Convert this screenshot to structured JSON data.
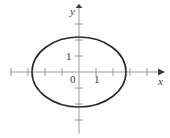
{
  "figure": {
    "name": "ellipse-coordinate-plot",
    "background_color": "#ffffff",
    "width": 170,
    "height": 138
  },
  "axes": {
    "x_axis": {
      "label": "x",
      "color": "#9a9a9a",
      "origin_px": 79,
      "y_px": 72,
      "start_px": 10,
      "end_px": 158,
      "arrow": "right",
      "arrow_color": "#3a3a3a",
      "tick_spacing_px": 17,
      "tick_positions_px": [
        11,
        28,
        45,
        62,
        96,
        113,
        130,
        147
      ],
      "tick_half_len_px": 4
    },
    "y_axis": {
      "label": "y",
      "color": "#9a9a9a",
      "origin_px": 72,
      "x_px": 79,
      "start_px": 8,
      "end_px": 134,
      "arrow": "up",
      "arrow_color": "#3a3a3a",
      "tick_spacing_px": 16,
      "tick_positions_px": [
        24,
        40,
        56,
        88,
        104,
        120
      ],
      "tick_half_len_px": 4
    }
  },
  "tick_labels": {
    "origin": "0",
    "x_one": "1",
    "y_one": "1"
  },
  "curve": {
    "type": "ellipse",
    "stroke_color": "#2b2b2b",
    "stroke_width_px": 1.6,
    "fill": "none",
    "center_px": {
      "x": 79,
      "y": 72
    },
    "semi_axis_x_px": 47,
    "semi_axis_y_px": 35,
    "semi_axis_x_units": 2.8,
    "semi_axis_y_units": 2.2
  },
  "chart_data": {
    "type": "line",
    "title": "",
    "xlabel": "x",
    "ylabel": "y",
    "xlim": [
      -4.1,
      4.6
    ],
    "ylim": [
      -4.1,
      4.1
    ],
    "xticks": [
      -4,
      -3,
      -2,
      -1,
      1,
      2,
      3,
      4
    ],
    "yticks": [
      -3,
      -2,
      -1,
      1,
      2,
      3
    ],
    "xtick_labels": [
      "",
      "",
      "",
      "",
      "1",
      "",
      "",
      ""
    ],
    "ytick_labels": [
      "",
      "",
      "",
      "1",
      "",
      ""
    ],
    "origin_label": "0",
    "grid": false,
    "legend": null,
    "series": [
      {
        "name": "ellipse",
        "equation": "x^2/2.8^2 + y^2/2.2^2 = 1",
        "semi_major_x": 2.8,
        "semi_minor_y": 2.2,
        "center": [
          0,
          0
        ],
        "closed": true
      }
    ]
  }
}
